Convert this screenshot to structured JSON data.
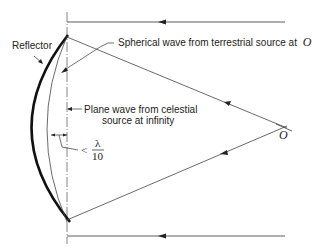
{
  "diagram": {
    "labels": {
      "reflector": "Reflector",
      "spherical_wave": "Spherical wave from terrestrial source at",
      "spherical_wave_point": "O",
      "plane_wave_line1": "Plane wave from celestial",
      "plane_wave_line2": "source at infinity",
      "tolerance_lt": "<",
      "tolerance_num": "λ",
      "tolerance_den": "10",
      "source_point": "O"
    },
    "colors": {
      "line": "#333333",
      "reflector": "#111111"
    }
  }
}
